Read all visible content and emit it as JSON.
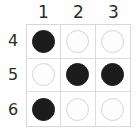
{
  "puzzle": {
    "title": "3x3 disc grid",
    "column_headers": [
      "1",
      "2",
      "3"
    ],
    "row_labels": [
      "4",
      "5",
      "6"
    ],
    "colors": {
      "filled_disc": "#1c1c1c",
      "open_disc_fill": "#fdfdfd",
      "open_disc_border": "#d4d4d4",
      "grid_line": "#dcdcdc",
      "grid_border": "#d8d8d8",
      "background": "#fefefe",
      "label_text": "#2b2b2b"
    },
    "cells": [
      {
        "row": "4",
        "col": "1",
        "state": "filled",
        "icon": "filled-disc-icon"
      },
      {
        "row": "4",
        "col": "2",
        "state": "open",
        "icon": "open-disc-icon"
      },
      {
        "row": "4",
        "col": "3",
        "state": "open",
        "icon": "open-disc-icon"
      },
      {
        "row": "5",
        "col": "1",
        "state": "open",
        "icon": "open-disc-icon"
      },
      {
        "row": "5",
        "col": "2",
        "state": "filled",
        "icon": "filled-disc-icon"
      },
      {
        "row": "5",
        "col": "3",
        "state": "filled",
        "icon": "filled-disc-icon"
      },
      {
        "row": "6",
        "col": "1",
        "state": "filled",
        "icon": "filled-disc-icon"
      },
      {
        "row": "6",
        "col": "2",
        "state": "open",
        "icon": "open-disc-icon"
      },
      {
        "row": "6",
        "col": "3",
        "state": "open",
        "icon": "open-disc-icon"
      }
    ]
  }
}
